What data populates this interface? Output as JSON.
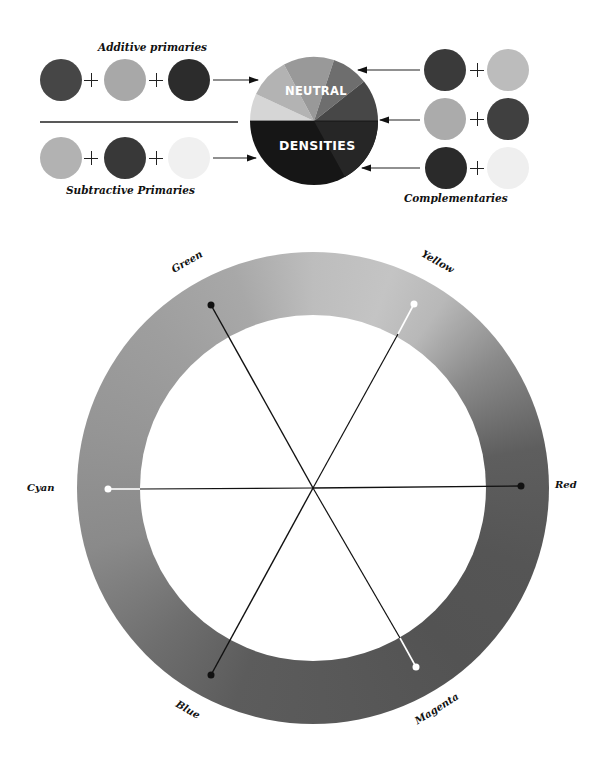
{
  "top_diagram": {
    "additive_label": "Additive primaries",
    "subtractive_label": "Subtractive Primaries",
    "complementaries_label": "Complementaries",
    "pie_top_label": "NEUTRAL",
    "pie_bottom_label": "DENSITIES",
    "plus_symbol": "+",
    "additive_swatches": [
      {
        "name": "red",
        "color": "#464646"
      },
      {
        "name": "green",
        "color": "#a8a8a8"
      },
      {
        "name": "blue",
        "color": "#2c2c2c"
      }
    ],
    "subtractive_swatches": [
      {
        "name": "cyan",
        "color": "#b2b2b2"
      },
      {
        "name": "magenta",
        "color": "#383838"
      },
      {
        "name": "yellow",
        "color": "#f0f0f0"
      }
    ],
    "complementary_pairs": [
      {
        "left": {
          "name": "red",
          "color": "#3a3a3a"
        },
        "right": {
          "name": "cyan",
          "color": "#bcbcbc"
        }
      },
      {
        "left": {
          "name": "green",
          "color": "#ababab"
        },
        "right": {
          "name": "magenta",
          "color": "#404040"
        }
      },
      {
        "left": {
          "name": "blue",
          "color": "#2a2a2a"
        },
        "right": {
          "name": "yellow",
          "color": "#efefef"
        }
      }
    ]
  },
  "color_wheel": {
    "labels": {
      "green": "Green",
      "yellow": "Yellow",
      "cyan": "Cyan",
      "red": "Red",
      "blue": "Blue",
      "magenta": "Magenta"
    },
    "spokes": [
      {
        "name": "red",
        "angle_deg": 0,
        "dot": "black"
      },
      {
        "name": "yellow",
        "angle_deg": -61,
        "dot": "white"
      },
      {
        "name": "green",
        "angle_deg": -120,
        "dot": "black"
      },
      {
        "name": "cyan",
        "angle_deg": 180,
        "dot": "white"
      },
      {
        "name": "blue",
        "angle_deg": 119,
        "dot": "black"
      },
      {
        "name": "magenta",
        "angle_deg": 60,
        "dot": "white"
      }
    ]
  }
}
